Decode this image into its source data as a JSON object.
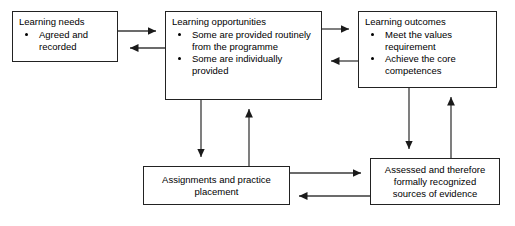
{
  "diagram": {
    "type": "flowchart",
    "background": "#ffffff",
    "line_color": "#333333",
    "border_color": "#222222",
    "nodes": [
      {
        "id": "learning-needs",
        "title": "Learning needs",
        "bullets": [
          "Agreed and recorded"
        ],
        "style": "titled-bullets"
      },
      {
        "id": "learning-opportunities",
        "title": "Learning opportunities",
        "bullets": [
          "Some are provided routinely from the programme",
          "Some are individually provided"
        ],
        "style": "titled-bullets"
      },
      {
        "id": "learning-outcomes",
        "title": "Learning outcomes",
        "bullets": [
          "Meet the values requirement",
          "Achieve the core competences"
        ],
        "style": "titled-bullets"
      },
      {
        "id": "assignments",
        "text": "Assignments and practice placement",
        "style": "centered"
      },
      {
        "id": "assessed",
        "text": "Assessed and therefore formally recognized sources of evidence",
        "style": "centered"
      }
    ],
    "connectors": [
      {
        "from": "learning-needs",
        "to": "learning-opportunities",
        "direction": "right"
      },
      {
        "from": "learning-opportunities",
        "to": "learning-needs",
        "direction": "left"
      },
      {
        "from": "learning-opportunities",
        "to": "learning-outcomes",
        "direction": "right"
      },
      {
        "from": "learning-outcomes",
        "to": "learning-opportunities",
        "direction": "left"
      },
      {
        "from": "learning-opportunities",
        "to": "assignments",
        "direction": "down"
      },
      {
        "from": "assignments",
        "to": "learning-opportunities",
        "direction": "up"
      },
      {
        "from": "learning-outcomes",
        "to": "assessed",
        "direction": "down"
      },
      {
        "from": "assessed",
        "to": "learning-outcomes",
        "direction": "up"
      },
      {
        "from": "assignments",
        "to": "assessed",
        "direction": "right"
      },
      {
        "from": "assessed",
        "to": "assignments",
        "direction": "left"
      }
    ]
  }
}
